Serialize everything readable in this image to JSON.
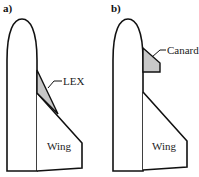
{
  "panels": [
    {
      "id": "a",
      "label": "a)",
      "parts": {
        "extension_label": "LEX",
        "wing_label": "Wing"
      }
    },
    {
      "id": "b",
      "label": "b)",
      "parts": {
        "extension_label": "Canard",
        "wing_label": "Wing"
      }
    }
  ],
  "colors": {
    "stroke": "#111111",
    "fill_highlight": "#c8c8c8",
    "background": "#ffffff"
  }
}
